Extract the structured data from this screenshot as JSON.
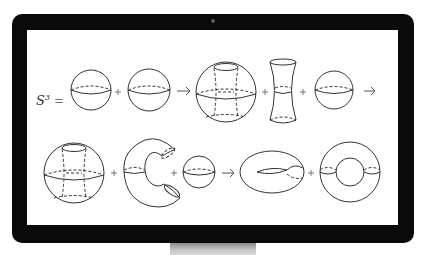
{
  "figure": {
    "lhs_symbol": "S",
    "lhs_superscript": "3",
    "equals": "=",
    "plus": "+",
    "arrow": "→",
    "row1": [
      "sphere",
      "plus",
      "sphere",
      "arrow",
      "sphere-with-tube-removed",
      "plus",
      "hyperboloid-tube",
      "plus",
      "sphere",
      "arrow"
    ],
    "row2": [
      "sphere-with-tube-removed",
      "plus",
      "c-shaped-handle",
      "plus",
      "sphere",
      "arrow",
      "torus-with-fold",
      "plus",
      "ring-torus"
    ]
  },
  "colors": {
    "bezel": "#0a0a0a",
    "screen": "#ffffff",
    "stroke": "#333333",
    "stand": "#b0b0b0"
  }
}
